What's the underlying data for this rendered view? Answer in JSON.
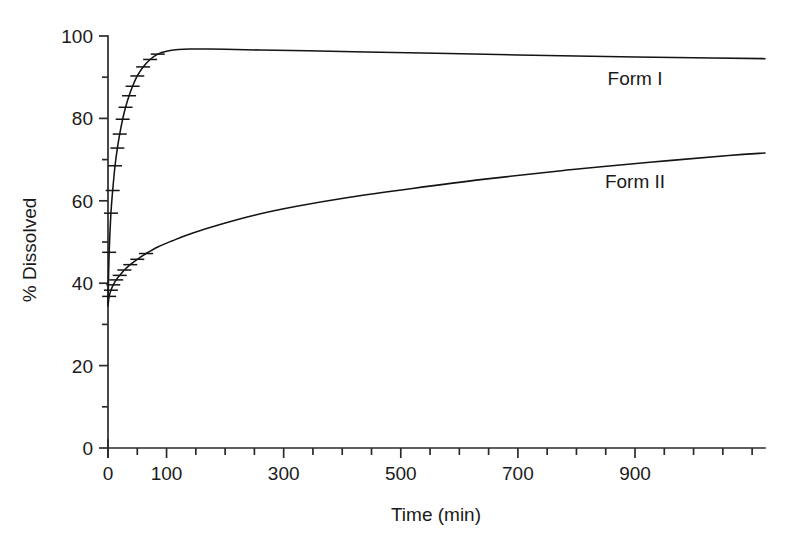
{
  "chart_data": {
    "type": "line",
    "title": "",
    "xlabel": "Time (min)",
    "ylabel": "% Dissolved",
    "xlim": [
      0,
      1122
    ],
    "ylim": [
      0,
      100
    ],
    "grid": false,
    "legend_position": "inline-right",
    "x_major_ticks": [
      0,
      100,
      300,
      500,
      700,
      900
    ],
    "x_major_tick_labels": [
      "0",
      "100",
      "300",
      "500",
      "700",
      "900"
    ],
    "x_all_ticks": [
      0,
      50,
      100,
      150,
      200,
      250,
      300,
      350,
      400,
      450,
      500,
      550,
      600,
      650,
      700,
      750,
      800,
      850,
      900,
      950,
      1000,
      1050,
      1100
    ],
    "y_major_ticks": [
      0,
      20,
      40,
      60,
      80,
      100
    ],
    "y_major_tick_labels": [
      "0",
      "20",
      "40",
      "60",
      "80",
      "100"
    ],
    "y_minor_ticks": [
      10,
      30,
      50,
      70,
      90
    ],
    "series": [
      {
        "name": "Form I",
        "label": "Form I",
        "label_x": 900,
        "label_y": 88,
        "color": "#141414",
        "x": [
          0,
          2,
          5,
          8,
          12,
          16,
          20,
          25,
          30,
          36,
          42,
          50,
          60,
          72,
          85,
          100,
          120,
          140,
          170,
          200,
          260,
          340,
          440,
          560,
          700,
          850,
          1000,
          1122
        ],
        "y": [
          35.0,
          47.5,
          57.0,
          62.5,
          68.5,
          72.8,
          76.2,
          79.8,
          82.7,
          85.5,
          87.8,
          90.3,
          92.5,
          94.3,
          95.6,
          96.3,
          96.7,
          96.85,
          96.85,
          96.8,
          96.6,
          96.4,
          96.1,
          95.8,
          95.4,
          95.0,
          94.7,
          94.5
        ],
        "error_bar_x": [
          2,
          5,
          8,
          12,
          16,
          20,
          25,
          30,
          36,
          42,
          50,
          60,
          72,
          85
        ]
      },
      {
        "name": "Form II",
        "label": "Form II",
        "label_x": 900,
        "label_y": 63,
        "color": "#141414",
        "x": [
          0,
          2,
          5,
          9,
          14,
          20,
          28,
          38,
          50,
          65,
          85,
          110,
          145,
          190,
          250,
          320,
          410,
          520,
          640,
          780,
          930,
          1060,
          1122
        ],
        "y": [
          34.5,
          36.8,
          38.3,
          39.6,
          40.8,
          41.9,
          43.2,
          44.5,
          45.8,
          47.2,
          48.8,
          50.3,
          52.2,
          54.2,
          56.5,
          58.6,
          60.8,
          63.0,
          65.2,
          67.4,
          69.4,
          71.0,
          71.6
        ],
        "error_bar_x": [
          2,
          5,
          9,
          14,
          20,
          28,
          38,
          50,
          65
        ]
      }
    ]
  }
}
